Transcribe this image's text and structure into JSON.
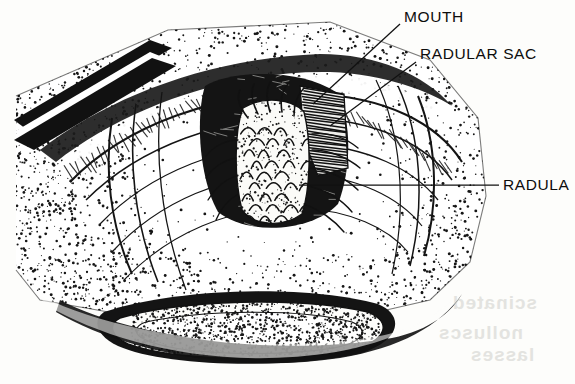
{
  "figure": {
    "kind": "scientific-line-illustration",
    "style": "stipple and hatch pen-and-ink scan, black on off-white paper",
    "background_color": "#fdfdfb",
    "ink_color": "#111111",
    "width": 575,
    "height": 384
  },
  "labels": [
    {
      "id": "mouth",
      "text": "MOUTH",
      "x": 404,
      "y": 9,
      "leader": {
        "from": [
          400,
          24
        ],
        "to": [
          313,
          104
        ]
      }
    },
    {
      "id": "sac",
      "text": "RADULAR SAC",
      "x": 420,
      "y": 46,
      "leader": {
        "from": [
          416,
          62
        ],
        "to": [
          330,
          126
        ]
      }
    },
    {
      "id": "radula",
      "text": "RADULA",
      "x": 503,
      "y": 177,
      "leader": {
        "from": [
          499,
          185
        ],
        "to": [
          299,
          185
        ]
      }
    }
  ],
  "parts": [
    {
      "name": "outer-tissue-field",
      "description": "stippled tissue surrounding the mouth"
    },
    {
      "name": "upper-lip-fold",
      "description": "hatched diagonal lip band across upper area"
    },
    {
      "name": "lip-contours",
      "description": "concentric curved lip contour lines"
    },
    {
      "name": "buccal-cavity",
      "description": "dark mouth opening"
    },
    {
      "name": "radula-ribbon",
      "description": "central toothed ribbon with chevron tooth rows"
    },
    {
      "name": "radular-sac",
      "description": "hatched sac at upper right of cavity"
    },
    {
      "name": "lower-lip-lens",
      "description": "elongated stippled oval below the mouth"
    },
    {
      "name": "top-left-dark-band",
      "description": "diagonal solid black band entering top-left"
    }
  ],
  "bleed_through": {
    "note": "faint mirrored ghost text from reverse of page, bottom-right",
    "color": "#cfcfca",
    "lines": [
      {
        "text": "scinated",
        "x": 452,
        "y": 300
      },
      {
        "text": "nolluscs",
        "x": 438,
        "y": 330
      },
      {
        "text": "lasses",
        "x": 470,
        "y": 352
      }
    ]
  }
}
